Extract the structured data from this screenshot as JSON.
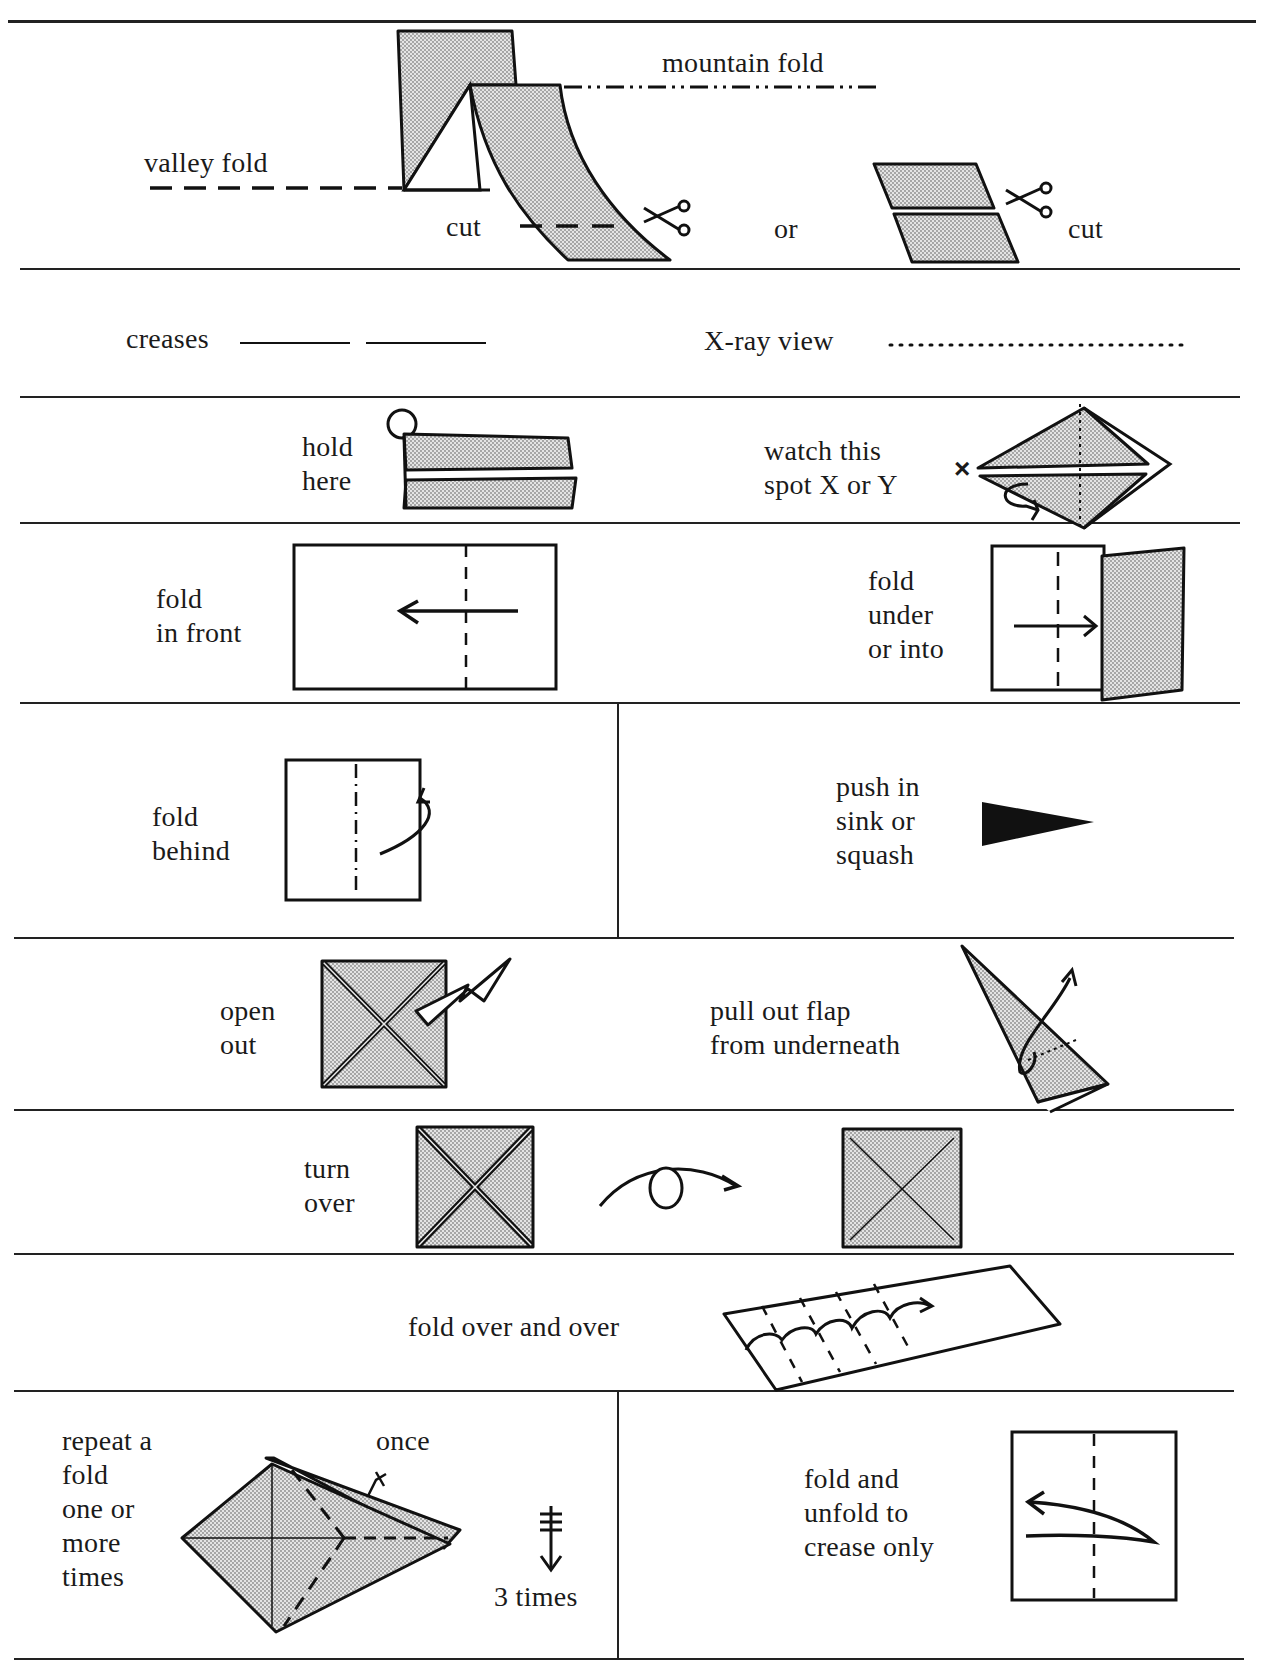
{
  "rows": {
    "r1": {
      "valley_fold": "valley fold",
      "mountain_fold": "mountain fold",
      "cut_left": "cut",
      "or": "or",
      "cut_right": "cut"
    },
    "r2": {
      "creases": "creases",
      "xray": "X-ray view"
    },
    "r3": {
      "hold_here": "hold\nhere",
      "watch_spot": "watch this\nspot X or Y",
      "x_mark": "×"
    },
    "r4": {
      "fold_in_front": "fold\nin front",
      "fold_under": "fold\nunder\nor into"
    },
    "r5": {
      "fold_behind": "fold\nbehind",
      "push_in": "push in\nsink or\nsquash"
    },
    "r6": {
      "open_out": "open\nout",
      "pull_out": "pull out flap\nfrom underneath"
    },
    "r7": {
      "turn_over": "turn\nover"
    },
    "r8": {
      "fold_over": "fold over and over"
    },
    "r9": {
      "repeat": "repeat a\nfold\none or\nmore\ntimes",
      "once": "once",
      "three_times": "3 times",
      "fold_unfold": "fold and\nunfold to\ncrease only"
    }
  },
  "colors": {
    "ink": "#111111",
    "paper_fill": "#d6d6d6",
    "background": "#ffffff"
  }
}
